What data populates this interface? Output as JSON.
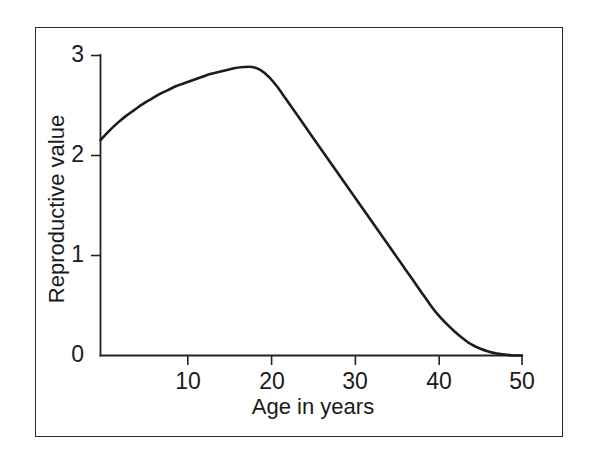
{
  "figure": {
    "frame_visible": true,
    "background_color": "#ffffff",
    "line_color": "#1c1c1c",
    "axis_color": "#222222"
  },
  "axis_titles": {
    "x": "Age in years",
    "y": "Reproductive value"
  },
  "ticks": {
    "y": [
      {
        "value": 3,
        "label": "3"
      },
      {
        "value": 2,
        "label": "2"
      },
      {
        "value": 1,
        "label": "1"
      },
      {
        "value": 0,
        "label": "0"
      }
    ],
    "x": [
      {
        "value": 10,
        "label": "10"
      },
      {
        "value": 20,
        "label": "20"
      },
      {
        "value": 30,
        "label": "30"
      },
      {
        "value": 40,
        "label": "40"
      },
      {
        "value": 50,
        "label": "50"
      }
    ]
  },
  "chart_data": {
    "type": "line",
    "title": "",
    "subtitle": "",
    "xlabel": "Age in years",
    "ylabel": "Reproductive value",
    "xlim": [
      0,
      50
    ],
    "ylim": [
      0,
      3
    ],
    "xticks": [
      10,
      20,
      30,
      40,
      50
    ],
    "yticks": [
      0,
      1,
      2,
      3
    ],
    "grid": false,
    "legend": null,
    "legend_position": "none",
    "annotations": [],
    "series": [
      {
        "name": "Reproductive value",
        "color": "#1c1c1c",
        "x": [
          0,
          1,
          2,
          3,
          4,
          5,
          6,
          7,
          8,
          9,
          10,
          11,
          12,
          13,
          14,
          15,
          16,
          17,
          18,
          19,
          20,
          21,
          22,
          23,
          24,
          25,
          26,
          27,
          28,
          29,
          30,
          31,
          32,
          33,
          34,
          35,
          36,
          37,
          38,
          39,
          40,
          41,
          42,
          43,
          44,
          45,
          46,
          47,
          48,
          49,
          50
        ],
        "y": [
          2.15,
          2.24,
          2.32,
          2.39,
          2.45,
          2.51,
          2.56,
          2.61,
          2.65,
          2.69,
          2.72,
          2.75,
          2.78,
          2.81,
          2.83,
          2.85,
          2.87,
          2.88,
          2.88,
          2.85,
          2.78,
          2.68,
          2.56,
          2.44,
          2.32,
          2.2,
          2.08,
          1.96,
          1.84,
          1.72,
          1.6,
          1.48,
          1.36,
          1.24,
          1.12,
          1.0,
          0.88,
          0.76,
          0.64,
          0.52,
          0.41,
          0.32,
          0.24,
          0.17,
          0.11,
          0.07,
          0.04,
          0.02,
          0.01,
          0.0,
          0.0
        ]
      }
    ],
    "notes": {
      "start_value": 2.15,
      "peak_value": 2.88,
      "peak_age": 17.5,
      "zero_age": 48
    }
  }
}
